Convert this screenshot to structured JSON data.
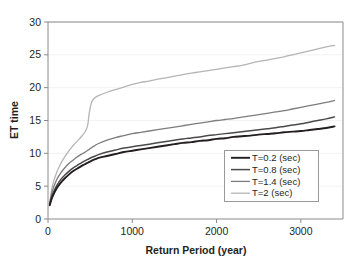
{
  "chart_data": {
    "type": "line",
    "title": "",
    "xlabel": "Return Period (year)",
    "ylabel": "ET time",
    "xlim": [
      0,
      3500
    ],
    "ylim": [
      0,
      30
    ],
    "xticks": [
      0,
      1000,
      2000,
      3000
    ],
    "yticks": [
      0,
      5,
      10,
      15,
      20,
      25,
      30
    ],
    "xtick_labels": [
      "0",
      "1000",
      "2000",
      "3000"
    ],
    "ytick_labels": [
      "0",
      "5",
      "10",
      "15",
      "20",
      "25",
      "30"
    ],
    "grid": "horizontal-faint",
    "legend_position": "lower-right-inside",
    "x": [
      20,
      50,
      100,
      150,
      200,
      250,
      300,
      350,
      400,
      430,
      460,
      475,
      490,
      520,
      560,
      600,
      700,
      800,
      900,
      1000,
      1100,
      1200,
      1300,
      1400,
      1500,
      1600,
      1700,
      1800,
      1900,
      2000,
      2100,
      2200,
      2300,
      2400,
      2500,
      2600,
      2700,
      2800,
      2900,
      3000,
      3100,
      3200,
      3300,
      3400
    ],
    "series": [
      {
        "name": "T=0.2 (sec)",
        "color": "#231f20",
        "width": 1.9,
        "values": [
          2.1,
          3.3,
          4.6,
          5.5,
          6.2,
          6.8,
          7.3,
          7.7,
          8.1,
          8.3,
          8.5,
          8.6,
          8.7,
          8.9,
          9.1,
          9.3,
          9.6,
          9.9,
          10.2,
          10.4,
          10.6,
          10.8,
          11.0,
          11.2,
          11.4,
          11.6,
          11.7,
          11.9,
          12.0,
          12.2,
          12.3,
          12.5,
          12.6,
          12.7,
          12.85,
          12.95,
          13.05,
          13.2,
          13.3,
          13.4,
          13.55,
          13.7,
          13.85,
          14.1
        ]
      },
      {
        "name": "T=0.8 (sec)",
        "color": "#4a4a4a",
        "width": 1.5,
        "values": [
          2.2,
          3.6,
          5.0,
          6.0,
          6.7,
          7.3,
          7.8,
          8.2,
          8.6,
          8.8,
          9.0,
          9.1,
          9.2,
          9.4,
          9.6,
          9.8,
          10.2,
          10.5,
          10.8,
          11.0,
          11.2,
          11.4,
          11.6,
          11.8,
          12.0,
          12.2,
          12.35,
          12.5,
          12.7,
          12.85,
          13.0,
          13.15,
          13.3,
          13.45,
          13.6,
          13.75,
          13.9,
          14.1,
          14.3,
          14.5,
          14.75,
          15.0,
          15.25,
          15.55
        ]
      },
      {
        "name": "T=1.4 (sec)",
        "color": "#7d7d7d",
        "width": 1.3,
        "values": [
          2.3,
          4.2,
          5.9,
          7.0,
          7.8,
          8.5,
          9.0,
          9.5,
          9.9,
          10.1,
          10.35,
          10.5,
          10.6,
          10.9,
          11.2,
          11.5,
          12.0,
          12.4,
          12.7,
          13.0,
          13.2,
          13.4,
          13.6,
          13.8,
          14.0,
          14.2,
          14.4,
          14.6,
          14.8,
          15.0,
          15.15,
          15.3,
          15.5,
          15.7,
          15.9,
          16.1,
          16.3,
          16.5,
          16.75,
          17.0,
          17.25,
          17.5,
          17.75,
          18.05
        ]
      },
      {
        "name": "T=2 (sec)",
        "color": "#b5b5b5",
        "width": 1.3,
        "values": [
          2.4,
          4.9,
          7.0,
          8.4,
          9.5,
          10.4,
          11.2,
          11.9,
          12.6,
          13.1,
          13.8,
          14.6,
          16.2,
          17.9,
          18.5,
          18.8,
          19.3,
          19.7,
          20.1,
          20.5,
          20.8,
          21.0,
          21.3,
          21.5,
          21.75,
          22.0,
          22.2,
          22.4,
          22.6,
          22.8,
          23.0,
          23.2,
          23.4,
          23.7,
          24.0,
          24.2,
          24.45,
          24.7,
          25.0,
          25.3,
          25.6,
          25.9,
          26.2,
          26.45
        ]
      }
    ],
    "legend": [
      {
        "label": "T=0.2 (sec)",
        "color": "#231f20",
        "width": 1.9
      },
      {
        "label": "T=0.8 (sec)",
        "color": "#4a4a4a",
        "width": 1.5
      },
      {
        "label": "T=1.4 (sec)",
        "color": "#7d7d7d",
        "width": 1.3
      },
      {
        "label": "T=2 (sec)",
        "color": "#b5b5b5",
        "width": 1.3
      }
    ]
  }
}
